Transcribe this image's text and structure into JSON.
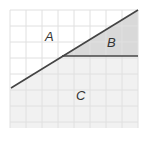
{
  "diagram": {
    "type": "geometry-regions",
    "grid": {
      "x0": 10,
      "y0": 10,
      "x1": 138,
      "y1": 128,
      "spacing": 16,
      "color": "#e2e2e2"
    },
    "lines": [
      {
        "name": "diagonal-line",
        "x1": 11,
        "y1": 88,
        "x2": 138,
        "y2": 10,
        "color": "#444444"
      },
      {
        "name": "horizontal-line",
        "x1": 62,
        "y1": 56,
        "x2": 138,
        "y2": 56,
        "color": "#444444"
      }
    ],
    "regions": [
      {
        "label": "A",
        "fill": "#ffffff"
      },
      {
        "label": "B",
        "fill": "#d9d9d9"
      },
      {
        "label": "C",
        "fill": "#f1f1f1"
      }
    ]
  }
}
